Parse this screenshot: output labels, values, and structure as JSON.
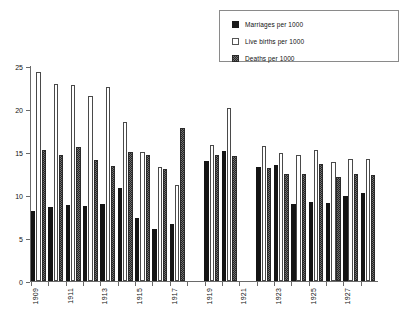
{
  "legend": {
    "position": "top-right",
    "items": [
      {
        "name": "marriages",
        "label": "Marriages per 1000",
        "swatch": "solid-black-square-icon",
        "color": "#141414"
      },
      {
        "name": "live_births",
        "label": "Live births per 1000",
        "swatch": "open-white-square-icon",
        "color": "#ffffff"
      },
      {
        "name": "deaths",
        "label": "Deaths per 1000",
        "swatch": "hatched-grey-square-icon",
        "color": "#6e6e6e"
      }
    ]
  },
  "axes": {
    "y_ticks": [
      0,
      5,
      10,
      15,
      20,
      25
    ],
    "y_tick_labels": [
      "0",
      "5",
      "10",
      "15",
      "20",
      "25"
    ],
    "x_tick_labels": [
      "1909",
      "1911",
      "1913",
      "1915",
      "1917",
      "1919",
      "1921",
      "1923",
      "1925",
      "1927"
    ]
  },
  "chart_data": {
    "type": "bar",
    "title": "",
    "subtitle": "",
    "xlabel": "",
    "ylabel": "",
    "ylim": [
      0,
      25
    ],
    "grid": false,
    "legend_position": "top-right",
    "categories": [
      "1909",
      "1910",
      "1911",
      "1912",
      "1913",
      "1914",
      "1915",
      "1916",
      "1917",
      "1918",
      "1919",
      "1920",
      "1921",
      "1922",
      "1923",
      "1924",
      "1925",
      "1926",
      "1927",
      "1928"
    ],
    "series": [
      {
        "name": "Marriages per 1000",
        "values": [
          8.1,
          8.6,
          8.8,
          8.7,
          9.0,
          10.8,
          7.3,
          6.1,
          6.6,
          null,
          14.0,
          15.1,
          null,
          13.3,
          13.5,
          9.0,
          9.2,
          9.1,
          9.9,
          10.2
        ]
      },
      {
        "name": "Live births per 1000",
        "values": [
          24.3,
          22.9,
          22.8,
          21.5,
          22.6,
          18.5,
          15.0,
          13.2,
          11.2,
          null,
          15.8,
          20.1,
          null,
          15.7,
          14.9,
          14.7,
          15.2,
          13.8,
          14.2,
          14.2
        ]
      },
      {
        "name": "Deaths per 1000",
        "values": [
          15.2,
          14.6,
          15.6,
          14.1,
          13.4,
          15.0,
          14.7,
          13.0,
          17.8,
          null,
          14.7,
          14.5,
          null,
          13.1,
          12.5,
          12.4,
          13.6,
          12.1,
          12.4,
          12.3
        ]
      }
    ]
  }
}
